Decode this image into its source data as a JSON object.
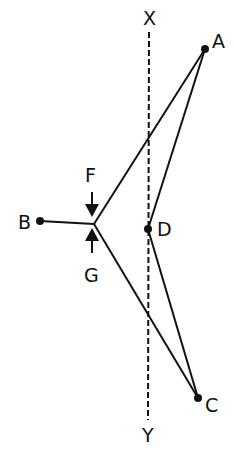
{
  "diagram": {
    "labels": {
      "X": "X",
      "Y": "Y",
      "A": "A",
      "B": "B",
      "C": "C",
      "D": "D",
      "F": "F",
      "G": "G"
    },
    "points": {
      "A": [
        205,
        49
      ],
      "B": [
        40,
        221
      ],
      "vertex": [
        94,
        224
      ],
      "D": [
        148,
        229
      ],
      "C": [
        198,
        398
      ]
    },
    "axis_line": {
      "x": 149,
      "y_top": 32,
      "y_bottom": 418,
      "style": "dashed"
    },
    "colors": {
      "line": "#111111",
      "background": "#ffffff"
    }
  }
}
